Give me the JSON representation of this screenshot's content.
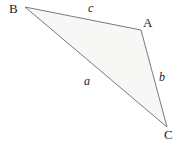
{
  "figure": {
    "type": "triangle-diagram",
    "width": 186,
    "height": 148,
    "background_color": "#ffffff",
    "fill_color": "#f7f7f5",
    "stroke_color": "#7a7a7a",
    "stroke_width": 1,
    "text_color": "#1c1c1c"
  },
  "vertices": [
    {
      "id": "B",
      "label": "B",
      "x": 25,
      "y": 7,
      "label_x": 9,
      "label_y": 2
    },
    {
      "id": "A",
      "label": "A",
      "x": 141,
      "y": 30,
      "label_x": 143,
      "label_y": 16
    },
    {
      "id": "C",
      "label": "C",
      "x": 167,
      "y": 127,
      "label_x": 164,
      "label_y": 128
    }
  ],
  "sides": [
    {
      "id": "c",
      "label": "c",
      "from": "B",
      "to": "A",
      "label_x": 88,
      "label_y": 2
    },
    {
      "id": "a",
      "label": "a",
      "from": "B",
      "to": "C",
      "label_x": 84,
      "label_y": 75
    },
    {
      "id": "b",
      "label": "b",
      "from": "A",
      "to": "C",
      "label_x": 159,
      "label_y": 71
    }
  ],
  "polygon_points": "25,7 141,30 167,127"
}
